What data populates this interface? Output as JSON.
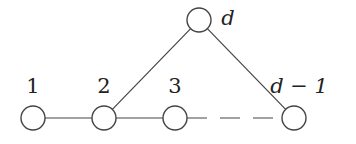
{
  "diagram": {
    "type": "graph",
    "style": {
      "stroke": "#444444",
      "node_fill": "#ffffff",
      "node_radius": 12
    },
    "nodes": [
      {
        "id": "n1",
        "label": "1",
        "x": 33,
        "y": 118,
        "label_x": 33,
        "label_y": 93,
        "italic": false
      },
      {
        "id": "n2",
        "label": "2",
        "x": 104,
        "y": 118,
        "label_x": 104,
        "label_y": 93,
        "italic": false
      },
      {
        "id": "n3",
        "label": "3",
        "x": 175,
        "y": 118,
        "label_x": 175,
        "label_y": 93,
        "italic": false
      },
      {
        "id": "nd1",
        "label": "d − 1",
        "x": 294,
        "y": 118,
        "label_x": 299,
        "label_y": 93,
        "italic": true
      },
      {
        "id": "nd",
        "label": "d",
        "x": 199,
        "y": 20,
        "label_x": 228,
        "label_y": 25,
        "italic": true
      }
    ],
    "edges": [
      {
        "from": "n1",
        "to": "n2",
        "style": "solid"
      },
      {
        "from": "n2",
        "to": "n3",
        "style": "solid"
      },
      {
        "from": "n3",
        "to": "nd1",
        "style": "dashed"
      },
      {
        "from": "n2",
        "to": "nd",
        "style": "solid"
      },
      {
        "from": "nd",
        "to": "nd1",
        "style": "solid"
      }
    ]
  }
}
